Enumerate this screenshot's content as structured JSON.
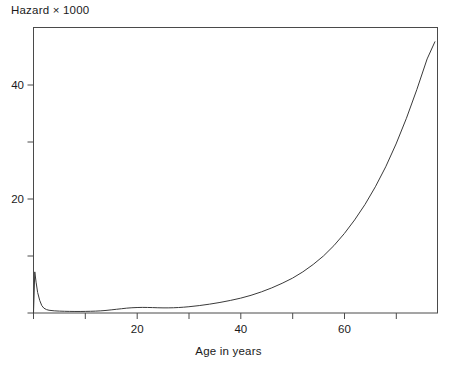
{
  "chart_data": {
    "type": "line",
    "title": "Hazard × 1000",
    "subtitle": "",
    "xlabel": "Age in years",
    "ylabel": "",
    "ylabel_text": "Hazard × 1000",
    "xlim": [
      0,
      78
    ],
    "ylim": [
      0,
      50
    ],
    "grid": false,
    "legend": null,
    "frame": "box",
    "line_color": "#3a3a3a",
    "xticks": [
      0,
      10,
      20,
      30,
      40,
      50,
      60,
      70
    ],
    "xticklabels": [
      "",
      "",
      "20",
      "",
      "40",
      "",
      "60",
      ""
    ],
    "xticks_labeled": [
      20,
      40,
      60
    ],
    "yticks": [
      0,
      10,
      20,
      30,
      40
    ],
    "yticklabels": [
      "",
      "",
      "20",
      "",
      "40"
    ],
    "yticks_labeled": [
      20,
      40
    ],
    "series": [
      {
        "name": "Hazard",
        "x": [
          0.0,
          0.25,
          0.5,
          0.8,
          1.2,
          1.6,
          2.0,
          2.5,
          3.0,
          4.0,
          5.0,
          6.0,
          7.0,
          8.0,
          9.0,
          10.0,
          11.0,
          12.0,
          13.0,
          14.0,
          15.0,
          16.0,
          17.0,
          18.0,
          19.0,
          20.0,
          21.0,
          22.0,
          23.0,
          24.0,
          25.0,
          26.0,
          27.0,
          28.0,
          29.0,
          30.0,
          32.0,
          34.0,
          36.0,
          38.0,
          40.0,
          42.0,
          44.0,
          46.0,
          48.0,
          50.0,
          52.0,
          54.0,
          56.0,
          58.0,
          60.0,
          62.0,
          64.0,
          66.0,
          68.0,
          70.0,
          72.0,
          74.0,
          76.0,
          77.5
        ],
        "y": [
          0.0,
          7.2,
          5.4,
          3.6,
          2.2,
          1.3,
          0.85,
          0.6,
          0.48,
          0.38,
          0.33,
          0.3,
          0.28,
          0.27,
          0.27,
          0.28,
          0.3,
          0.33,
          0.38,
          0.45,
          0.55,
          0.65,
          0.75,
          0.85,
          0.92,
          0.96,
          0.98,
          0.97,
          0.95,
          0.92,
          0.9,
          0.9,
          0.92,
          0.96,
          1.02,
          1.1,
          1.3,
          1.55,
          1.85,
          2.2,
          2.6,
          3.1,
          3.7,
          4.4,
          5.2,
          6.1,
          7.2,
          8.5,
          10.0,
          11.8,
          13.9,
          16.3,
          19.0,
          22.1,
          25.6,
          29.6,
          34.1,
          39.1,
          44.5,
          47.5
        ]
      }
    ],
    "annotations": []
  },
  "axes": {
    "x": {
      "label": "Age in years",
      "ticks": [
        {
          "value": 0,
          "label": ""
        },
        {
          "value": 10,
          "label": ""
        },
        {
          "value": 20,
          "label": "20"
        },
        {
          "value": 30,
          "label": ""
        },
        {
          "value": 40,
          "label": "40"
        },
        {
          "value": 50,
          "label": ""
        },
        {
          "value": 60,
          "label": "60"
        },
        {
          "value": 70,
          "label": ""
        }
      ]
    },
    "y": {
      "label": "Hazard × 1000",
      "ticks": [
        {
          "value": 0,
          "label": ""
        },
        {
          "value": 10,
          "label": ""
        },
        {
          "value": 20,
          "label": "20"
        },
        {
          "value": 30,
          "label": ""
        },
        {
          "value": 40,
          "label": "40"
        }
      ]
    }
  },
  "tick_text": {
    "x20": "20",
    "x40": "40",
    "x60": "60",
    "y20": "20",
    "y40": "40"
  },
  "title": "Hazard × 1000",
  "colors": {
    "background": "#ffffff",
    "axis": "#4a4a4a",
    "line": "#3a3a3a",
    "text": "#1a1a1a"
  }
}
